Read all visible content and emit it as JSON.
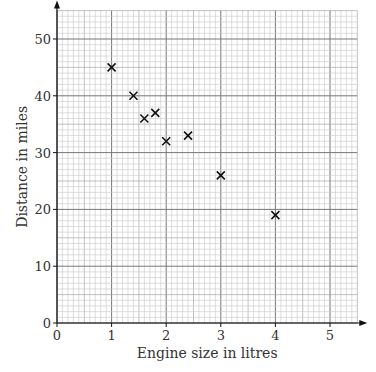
{
  "chart_data": {
    "type": "scatter",
    "title": "",
    "xlabel": "Engine size in litres",
    "ylabel": "Distance in miles",
    "xlim": [
      0,
      5.5
    ],
    "ylim": [
      0,
      55
    ],
    "xticks": [
      0,
      1,
      2,
      3,
      4,
      5
    ],
    "yticks": [
      0,
      10,
      20,
      30,
      40,
      50
    ],
    "grid": true,
    "marker": "x",
    "points": [
      {
        "x": 1.0,
        "y": 45
      },
      {
        "x": 1.4,
        "y": 40
      },
      {
        "x": 1.6,
        "y": 36
      },
      {
        "x": 1.8,
        "y": 37
      },
      {
        "x": 2.0,
        "y": 32
      },
      {
        "x": 2.4,
        "y": 33
      },
      {
        "x": 3.0,
        "y": 26
      },
      {
        "x": 4.0,
        "y": 19
      }
    ]
  }
}
